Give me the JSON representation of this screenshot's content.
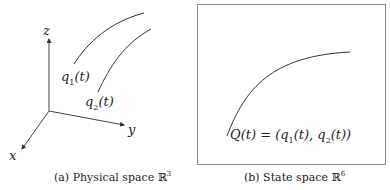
{
  "panel_a": {
    "axes": {
      "x_label": "x",
      "y_label": "y",
      "z_label": "z"
    },
    "curves": [
      {
        "name": "q",
        "sub": "1",
        "arg": "(t)"
      },
      {
        "name": "q",
        "sub": "2",
        "arg": "(t)"
      }
    ],
    "caption": {
      "prefix": "(a) Physical space ",
      "set": "ℝ",
      "power": "3"
    }
  },
  "panel_b": {
    "curve_label": {
      "lhs": "Q(t) = (",
      "q1": "q",
      "s1": "1",
      "a1": "(t), ",
      "q2": "q",
      "s2": "2",
      "a2": "(t))"
    },
    "caption": {
      "prefix": "(b) State space ",
      "set": "ℝ",
      "power": "6"
    }
  },
  "colors": {
    "line": "#333333",
    "frame": "#8a8a8a"
  }
}
